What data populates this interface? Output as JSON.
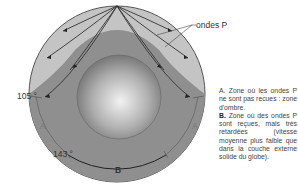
{
  "figure": {
    "labels": {
      "waves": "ondes P",
      "angle_105": "105 °",
      "angle_143": "143 °",
      "zone_a_left": "A",
      "zone_a_right": "A",
      "zone_b": "B"
    },
    "colors": {
      "mantle": "#c4c4c4",
      "shadow_zone": "#8f8f8f",
      "core_light": "#e6e6e6",
      "core_dark": "#6e6e6e",
      "outline": "#555555",
      "ray": "#333333"
    }
  },
  "caption": {
    "a_key": "A.",
    "a_text": " Zone où les ondes P ne sont pas recues : zone d'ombre.",
    "b_key": "B.",
    "b_text": " Zone où des ondes P sont reçues, mais très retardées (vitesse moyenne plus faible que dans la couche externe solide du globe)."
  }
}
